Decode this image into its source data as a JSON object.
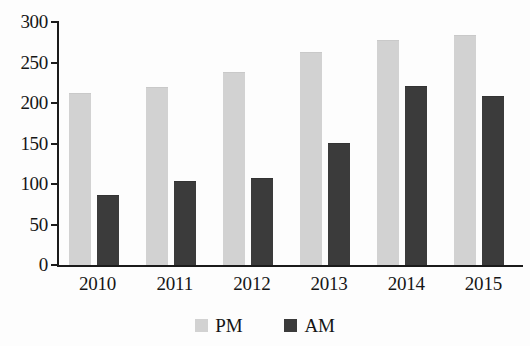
{
  "chart_data": {
    "type": "bar",
    "title": "",
    "subtitle": "",
    "xlabel": "",
    "ylabel": "",
    "categories": [
      "2010",
      "2011",
      "2012",
      "2013",
      "2014",
      "2015"
    ],
    "series": [
      {
        "name": "PM",
        "color": "#d2d2d2",
        "values": [
          211,
          219,
          237,
          262,
          277,
          283
        ]
      },
      {
        "name": "AM",
        "color": "#3b3b3b",
        "values": [
          85,
          102,
          106,
          150,
          220,
          207
        ]
      }
    ],
    "ylim": [
      0,
      300
    ],
    "yticks": [
      0,
      50,
      100,
      150,
      200,
      250,
      300
    ],
    "ytick_labels": [
      "0",
      "50",
      "100",
      "150",
      "200",
      "250",
      "300"
    ],
    "grid": false,
    "legend_position": "bottom-center",
    "legend": [
      "PM",
      "AM"
    ],
    "annotations": []
  },
  "axes": {
    "y_tick_labels": [
      "300",
      "250",
      "200",
      "150",
      "100",
      "50",
      "0"
    ],
    "x_tick_labels": [
      "2010",
      "2011",
      "2012",
      "2013",
      "2014",
      "2015"
    ]
  },
  "legend": {
    "items": [
      {
        "label": "PM",
        "color": "#d2d2d2"
      },
      {
        "label": "AM",
        "color": "#3b3b3b"
      }
    ]
  }
}
